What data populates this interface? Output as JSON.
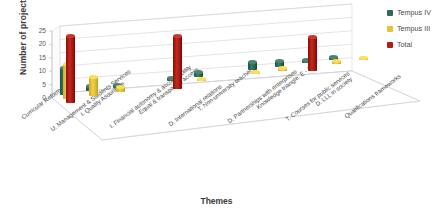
{
  "chart_data": {
    "type": "bar",
    "title": "",
    "xlabel": "Themes",
    "ylabel": "Number of projects",
    "ylim": [
      0,
      25
    ],
    "yticks": [
      0,
      5,
      10,
      15,
      20,
      25
    ],
    "grid": true,
    "legend_position": "top-right",
    "three_d": true,
    "categories": [
      "Curricular Reform",
      "U. Management & Students Services",
      "I. Quality Assurance",
      "I. Financial autonomy & accountability",
      "Equal & transparent access",
      "D. International relations",
      "T. Non-university teachers",
      "D. Partnerships with enterprises",
      "Knowledge triangle: E - I-R",
      "T. Courses for public services",
      "D. LLL in society",
      "Qualifications frameworks"
    ],
    "series": [
      {
        "name": "Tempus IV",
        "color": "#2f6b58",
        "values": [
          10,
          2,
          1,
          0,
          1,
          2,
          0,
          3,
          2,
          1,
          1,
          0
        ]
      },
      {
        "name": "Tempus III",
        "color": "#e4c23c",
        "values": [
          13,
          7,
          2,
          0,
          0,
          1,
          0,
          1,
          1,
          0,
          1,
          1
        ]
      },
      {
        "name": "Total",
        "color": "#ad1f14",
        "values": [
          25,
          0,
          0,
          0,
          20,
          0,
          0,
          0,
          0,
          13,
          0,
          0
        ]
      }
    ]
  },
  "legend": {
    "items": [
      {
        "label": "Tempus IV",
        "color": "#2f6b58"
      },
      {
        "label": "Tempus III",
        "color": "#e4c23c"
      },
      {
        "label": "Total",
        "color": "#ad1f14"
      }
    ]
  },
  "axes": {
    "y_title": "Number of projects",
    "x_title": "Themes",
    "y_tick_labels": [
      "25",
      "20",
      "15",
      "10",
      "5",
      "0"
    ]
  }
}
